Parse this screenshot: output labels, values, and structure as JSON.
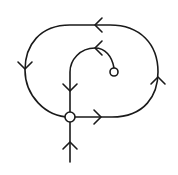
{
  "diagram": {
    "type": "phase-portrait",
    "colors": {
      "stroke": "#1a1a1a",
      "background": "#ffffff",
      "node_fill": "#ffffff"
    },
    "nodes": [
      {
        "id": "saddle",
        "kind": "saddle-point",
        "cx": 70,
        "cy": 117,
        "r": 5
      },
      {
        "id": "source",
        "kind": "unstable-point",
        "cx": 114,
        "cy": 72,
        "r": 4
      }
    ],
    "trajectories": [
      {
        "id": "homoclinic-loop",
        "arrows": [
          "right",
          "up",
          "left",
          "down"
        ]
      },
      {
        "id": "inner-orbit",
        "arrows": [
          "left",
          "down"
        ]
      },
      {
        "id": "incoming-tail",
        "arrows": [
          "up"
        ]
      }
    ]
  }
}
